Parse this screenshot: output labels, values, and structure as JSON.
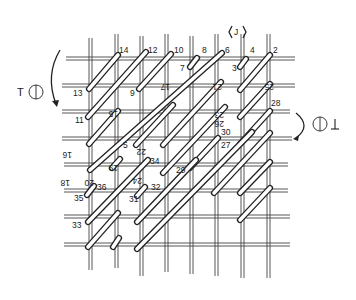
{
  "figure": {
    "type": "woven lattice patent drawing",
    "direction_marker_top": "J",
    "left_marker": "T",
    "right_marker": "T (inverted)",
    "labels": [
      {
        "text": "14",
        "x": 118,
        "y": 52
      },
      {
        "text": "12",
        "x": 148,
        "y": 52
      },
      {
        "text": "10",
        "x": 173,
        "y": 52
      },
      {
        "text": "8",
        "x": 201,
        "y": 52
      },
      {
        "text": "6",
        "x": 225,
        "y": 52
      },
      {
        "text": "4",
        "x": 250,
        "y": 52
      },
      {
        "text": "2",
        "x": 274,
        "y": 52
      },
      {
        "text": "7",
        "x": 180,
        "y": 70
      },
      {
        "text": "3",
        "x": 232,
        "y": 70
      },
      {
        "text": "13",
        "x": 74,
        "y": 95
      },
      {
        "text": "9",
        "x": 130,
        "y": 95
      },
      {
        "text": "17",
        "x": 170,
        "y": 82,
        "rotated": true
      },
      {
        "text": "21",
        "x": 228,
        "y": 82,
        "rotated": true
      },
      {
        "text": "25",
        "x": 278,
        "y": 82,
        "rotated": true
      },
      {
        "text": "11",
        "x": 76,
        "y": 122
      },
      {
        "text": "15",
        "x": 122,
        "y": 110,
        "rotated": true
      },
      {
        "text": "23",
        "x": 228,
        "y": 110,
        "rotated": true
      },
      {
        "text": "28",
        "x": 270,
        "y": 105
      },
      {
        "text": "26",
        "x": 228,
        "y": 119,
        "rotated": true
      },
      {
        "text": "16",
        "x": 76,
        "y": 150,
        "rotated": true
      },
      {
        "text": "5",
        "x": 122,
        "y": 147
      },
      {
        "text": "22",
        "x": 150,
        "y": 147,
        "rotated": true
      },
      {
        "text": "30",
        "x": 221,
        "y": 134
      },
      {
        "text": "27",
        "x": 221,
        "y": 147
      },
      {
        "text": "19",
        "x": 122,
        "y": 163,
        "rotated": true
      },
      {
        "text": "34",
        "x": 150,
        "y": 163
      },
      {
        "text": "18",
        "x": 74,
        "y": 178,
        "rotated": true
      },
      {
        "text": "20",
        "x": 98,
        "y": 178,
        "rotated": true
      },
      {
        "text": "24",
        "x": 146,
        "y": 176,
        "rotated": true
      },
      {
        "text": "29",
        "x": 177,
        "y": 172
      },
      {
        "text": "36",
        "x": 97,
        "y": 189
      },
      {
        "text": "32",
        "x": 150,
        "y": 189
      },
      {
        "text": "35",
        "x": 74,
        "y": 200
      },
      {
        "text": "31",
        "x": 130,
        "y": 201
      },
      {
        "text": "33",
        "x": 72,
        "y": 227
      }
    ]
  }
}
